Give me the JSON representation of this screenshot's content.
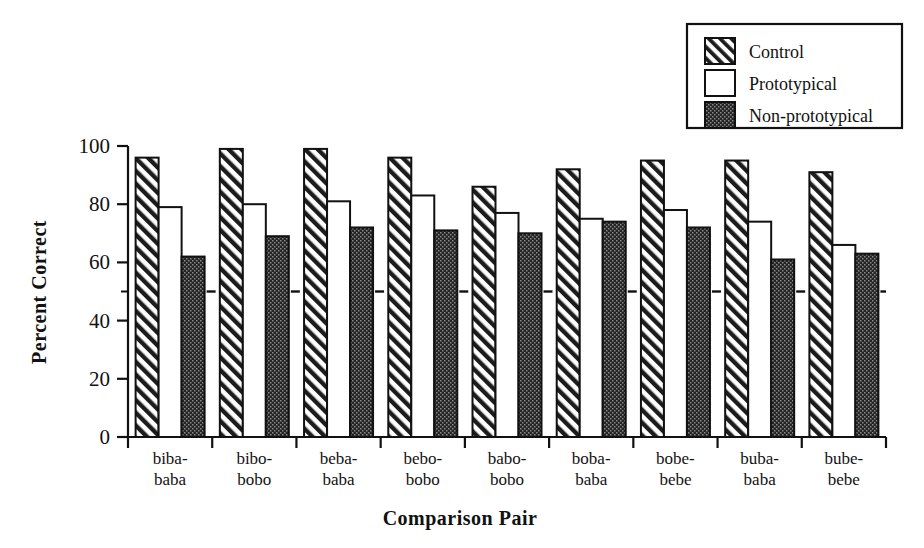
{
  "chart_data": {
    "type": "bar",
    "title": "",
    "xlabel": "Comparison Pair",
    "ylabel": "Percent Correct",
    "categories": [
      "biba-\nbaba",
      "bibo-\nbobo",
      "beba-\nbaba",
      "bebo-\nbobo",
      "babo-\nbobo",
      "boba-\nbaba",
      "bobe-\nbebe",
      "buba-\nbaba",
      "bube-\nbebe"
    ],
    "category_lines": [
      [
        "biba-",
        "baba"
      ],
      [
        "bibo-",
        "bobo"
      ],
      [
        "beba-",
        "baba"
      ],
      [
        "bebo-",
        "bobo"
      ],
      [
        "babo-",
        "bobo"
      ],
      [
        "boba-",
        "baba"
      ],
      [
        "bobe-",
        "bebe"
      ],
      [
        "buba-",
        "baba"
      ],
      [
        "bube-",
        "bebe"
      ]
    ],
    "series": [
      {
        "name": "Control",
        "pattern": "diagonal-hatch",
        "values": [
          96,
          99,
          99,
          96,
          86,
          92,
          95,
          95,
          91
        ]
      },
      {
        "name": "Prototypical",
        "pattern": "open-white",
        "values": [
          79,
          80,
          81,
          83,
          77,
          75,
          78,
          74,
          66
        ]
      },
      {
        "name": "Non-prototypical",
        "pattern": "dark-dotted",
        "values": [
          62,
          69,
          72,
          71,
          70,
          74,
          72,
          61,
          63
        ]
      }
    ],
    "ylim": [
      0,
      100
    ],
    "yticks": [
      0,
      20,
      40,
      60,
      80,
      100
    ],
    "ytick_labels": [
      "0",
      "20",
      "40",
      "60",
      "80",
      "100"
    ],
    "minor_yticks": [
      50
    ],
    "reference_line": {
      "value": 50,
      "style": "dashed",
      "label": "chance"
    },
    "grid": false,
    "legend_position": "top-right",
    "colors": {
      "axis": "#111111",
      "control_fill": "#ffffff",
      "control_stroke": "#111111",
      "prototypical_fill": "#ffffff",
      "prototypical_stroke": "#111111",
      "nonprototypical_fill": "#262626",
      "nonprototypical_stroke": "#111111",
      "reference_line": "#111111",
      "background": "#ffffff"
    }
  },
  "legend": {
    "items": [
      {
        "label": "Control",
        "swatch": "diagonal-hatch-swatch"
      },
      {
        "label": "Prototypical",
        "swatch": "open-white-swatch"
      },
      {
        "label": "Non-prototypical",
        "swatch": "dark-dotted-swatch"
      }
    ]
  },
  "axes": {
    "y_title": "Percent Correct",
    "x_title": "Comparison Pair"
  }
}
